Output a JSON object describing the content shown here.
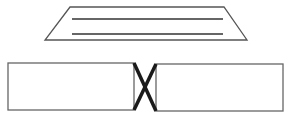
{
  "diagram": {
    "colors": {
      "stroke": "#555555",
      "inner_lines": "#333333",
      "connector": "#1a1a1a",
      "background": "#ffffff"
    },
    "trapezoid": {
      "points": [
        [
          70,
          7
        ],
        [
          224,
          7
        ],
        [
          247,
          40
        ],
        [
          45,
          40
        ]
      ],
      "lines": [
        {
          "x1": 72,
          "y1": 19,
          "x2": 223,
          "y2": 19
        },
        {
          "x1": 72,
          "y1": 34,
          "x2": 223,
          "y2": 34
        }
      ]
    },
    "left_rect": {
      "x": 8,
      "y": 63,
      "width": 126,
      "height": 47
    },
    "right_rect": {
      "x": 156,
      "y": 64,
      "width": 127,
      "height": 47
    },
    "connector": {
      "type": "X",
      "lines": [
        {
          "x1": 134,
          "y1": 63,
          "x2": 156,
          "y2": 111
        },
        {
          "x1": 156,
          "y1": 64,
          "x2": 134,
          "y2": 110
        }
      ]
    }
  }
}
